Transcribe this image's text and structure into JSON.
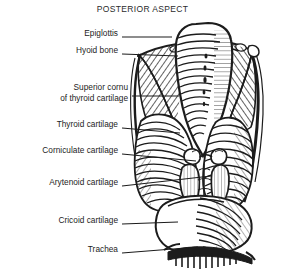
{
  "figure": {
    "title": "POSTERIOR ASPECT",
    "style": "line-engraving",
    "ink_color": "#1c1c1c",
    "background_color": "#ffffff"
  },
  "labels": [
    {
      "id": "epiglottis",
      "text": "Epiglottis",
      "lines": [
        "Epiglottis"
      ],
      "label_right_x": 118,
      "label_y": 33,
      "leader": {
        "x1": 122,
        "y1": 37,
        "x2": 172,
        "y2": 37
      }
    },
    {
      "id": "hyoid-bone",
      "text": "Hyoid bone",
      "lines": [
        "Hyoid bone"
      ],
      "label_right_x": 118,
      "label_y": 50,
      "leader": {
        "x1": 122,
        "y1": 54,
        "x2": 178,
        "y2": 56
      }
    },
    {
      "id": "superior-cornu-of-thyroid-cartilage",
      "text": "Superior cornu of thyroid cartilage",
      "lines": [
        "Superior cornu",
        "of thyroid cartilage"
      ],
      "label_right_x": 128,
      "label_y": 82,
      "leader": {
        "x1": 132,
        "y1": 96,
        "x2": 179,
        "y2": 96
      }
    },
    {
      "id": "thyroid-cartilage",
      "text": "Thyroid cartilage",
      "lines": [
        "Thyroid cartilage"
      ],
      "label_right_x": 118,
      "label_y": 124,
      "leader": {
        "x1": 122,
        "y1": 128,
        "x2": 180,
        "y2": 133
      }
    },
    {
      "id": "corniculate-cartilage",
      "text": "Corniculate cartilage",
      "lines": [
        "Corniculate cartilage"
      ],
      "label_right_x": 118,
      "label_y": 150,
      "leader": {
        "x1": 122,
        "y1": 154,
        "x2": 196,
        "y2": 161
      }
    },
    {
      "id": "arytenoid-cartilage",
      "text": "Arytenoid cartilage",
      "lines": [
        "Arytenoid cartilage"
      ],
      "label_right_x": 118,
      "label_y": 182,
      "leader": {
        "x1": 122,
        "y1": 186,
        "x2": 210,
        "y2": 175
      }
    },
    {
      "id": "cricoid-cartilage",
      "text": "Cricoid cartilage",
      "lines": [
        "Cricoid cartilage"
      ],
      "label_right_x": 118,
      "label_y": 220,
      "leader": {
        "x1": 122,
        "y1": 224,
        "x2": 178,
        "y2": 222
      }
    },
    {
      "id": "trachea",
      "text": "Trachea",
      "lines": [
        "Trachea"
      ],
      "label_right_x": 118,
      "label_y": 249,
      "leader": {
        "x1": 122,
        "y1": 253,
        "x2": 196,
        "y2": 248
      }
    }
  ]
}
